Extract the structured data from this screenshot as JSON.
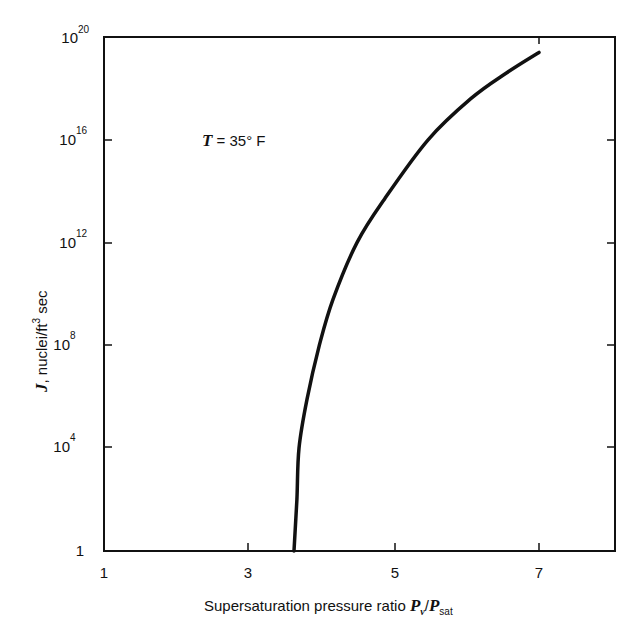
{
  "chart_data": {
    "type": "line",
    "title": "",
    "xlabel": "Supersaturation pressure ratio P_v/P_sat",
    "ylabel": "J, nuclei/ft^3 sec",
    "x_scale": "linear",
    "y_scale": "log",
    "xlim": [
      1,
      8
    ],
    "ylim": [
      1,
      1e+20
    ],
    "x_ticks": [
      1,
      3,
      5,
      7
    ],
    "y_ticks": [
      1,
      10000.0,
      100000000.0,
      1000000000000.0,
      1e+16,
      1e+20
    ],
    "x_tick_labels": [
      "1",
      "3",
      "5",
      "7"
    ],
    "y_tick_labels": [
      {
        "base": "1",
        "exp": ""
      },
      {
        "base": "10",
        "exp": "4"
      },
      {
        "base": "10",
        "exp": "8"
      },
      {
        "base": "10",
        "exp": "12"
      },
      {
        "base": "10",
        "exp": "16"
      },
      {
        "base": "10",
        "exp": "20"
      }
    ],
    "grid": false,
    "legend": null,
    "annotations": [
      {
        "text": "T = 35° F",
        "x": 2.9,
        "y_log10": 16.1
      }
    ],
    "series": [
      {
        "name": "T = 35° F",
        "x": [
          3.62,
          3.66,
          3.69,
          3.8,
          3.97,
          4.16,
          4.49,
          4.87,
          5.47,
          6.06,
          6.55,
          7.0
        ],
        "log10_y": [
          0,
          2.0,
          4.0,
          5.9,
          8.0,
          9.8,
          12.0,
          13.7,
          16.0,
          17.6,
          18.6,
          19.4
        ]
      }
    ]
  },
  "labels": {
    "x_tick_1": "1",
    "x_tick_3": "3",
    "x_tick_5": "5",
    "x_tick_7": "7",
    "y_tick_0": "1",
    "y_base": "10",
    "y_exp_4": "4",
    "y_exp_8": "8",
    "y_exp_12": "12",
    "y_exp_16": "16",
    "y_exp_20": "20",
    "xlabel_text": "Supersaturation pressure ratio ",
    "xlabel_P": "P",
    "xlabel_v": "v",
    "xlabel_slash": "/",
    "xlabel_sat": "sat",
    "ylabel_J": "J",
    "ylabel_rest": ", nuclei/ft",
    "ylabel_exp": "3",
    "ylabel_sec": " sec",
    "annotation_T": "T",
    "annotation_rest": " = 35° F"
  }
}
